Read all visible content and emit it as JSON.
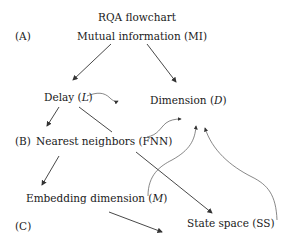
{
  "title": "RQA flowchart",
  "stage_labels": {
    "a": "(A)",
    "b": "(B)",
    "c": "(C)"
  },
  "nodes": {
    "mi": {
      "text": "Mutual information (MI)"
    },
    "delay": {
      "text": "Delay (",
      "var": "L",
      "close": ")"
    },
    "dimension": {
      "text": "Dimension (",
      "var": "D",
      "close": ")"
    },
    "fnn": {
      "text": "Nearest neighbors (FNN)"
    },
    "embedding": {
      "text": "Embedding dimension (",
      "var": "M",
      "close": ")"
    },
    "statespace": {
      "text": "State space (SS)"
    }
  },
  "colors": {
    "text": "#1a1a1a",
    "arrow": "#333333",
    "curve": "#555555"
  }
}
